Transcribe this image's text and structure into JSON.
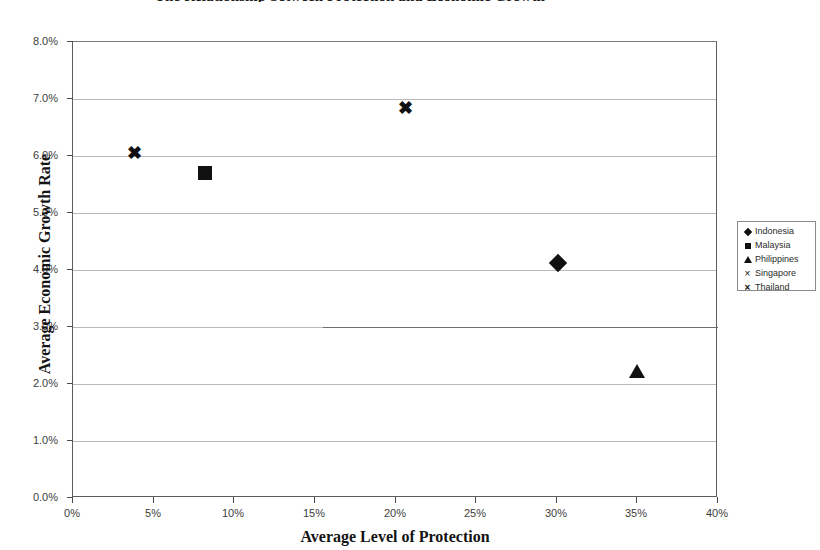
{
  "chart_data": {
    "type": "scatter",
    "title": "The Relationship between Protection and Economic Growth",
    "xlabel": "Average Level of Protection",
    "ylabel": "Average Economic Growth Rate",
    "xlim": [
      0,
      40
    ],
    "ylim": [
      0,
      8
    ],
    "grid": true,
    "legend_position": "right",
    "x_tick_labels": [
      "0%",
      "5%",
      "10%",
      "15%",
      "20%",
      "25%",
      "30%",
      "35%",
      "40%"
    ],
    "x_tick_values": [
      0,
      5,
      10,
      15,
      20,
      25,
      30,
      35,
      40
    ],
    "y_tick_labels": [
      "0.0%",
      "1.0%",
      "2.0%",
      "3.0%",
      "4.0%",
      "5.0%",
      "6.0%",
      "7.0%",
      "8.0%"
    ],
    "y_tick_values": [
      0,
      1,
      2,
      3,
      4,
      5,
      6,
      7,
      8
    ],
    "series": [
      {
        "name": "Indonesia",
        "marker": "diamond",
        "x": [
          30.1
        ],
        "y": [
          4.13
        ]
      },
      {
        "name": "Malaysia",
        "marker": "square",
        "x": [
          8.2
        ],
        "y": [
          5.7
        ]
      },
      {
        "name": "Philippines",
        "marker": "triangle",
        "x": [
          35.0
        ],
        "y": [
          2.22
        ]
      },
      {
        "name": "Singapore",
        "marker": "cross",
        "x": [
          20.6
        ],
        "y": [
          6.85
        ]
      },
      {
        "name": "Thailand",
        "marker": "cross-bold",
        "x": [
          3.8
        ],
        "y": [
          6.05
        ]
      }
    ],
    "annotations": [
      {
        "type": "stray-rule",
        "y": 3.0,
        "x_start": 15.5,
        "x_end": 40.0
      }
    ]
  },
  "legend": {
    "items": [
      {
        "label": "Indonesia",
        "glyph": "♦",
        "key": "diamond"
      },
      {
        "label": "Malaysia",
        "glyph": "■",
        "key": "square"
      },
      {
        "label": "Philippines",
        "glyph": "▲",
        "key": "triangle"
      },
      {
        "label": "Singapore",
        "glyph": "×",
        "key": "cross"
      },
      {
        "label": "Thailand",
        "glyph": "×",
        "key": "cross-bold"
      }
    ]
  },
  "markers": {
    "singapore_glyph": "✖",
    "thailand_glyph": "✖"
  },
  "colors": {
    "marker": "#111111",
    "grid": "#b9b9b9",
    "axis": "#5c5c5c",
    "text": "#3d3d3d",
    "background": "#ffffff"
  }
}
